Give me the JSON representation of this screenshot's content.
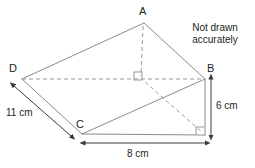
{
  "figure": {
    "kind": "triangular-prism-wedge-diagram",
    "note_line1": "Not drawn",
    "note_line2": "accurately",
    "stroke_color": "#8c8c8c",
    "dash_color": "#9a9a9a",
    "text_color": "#231f20",
    "vertices": [
      {
        "name": "A",
        "label": "A",
        "x": 144,
        "y": 23
      },
      {
        "name": "B",
        "label": "B",
        "x": 205,
        "y": 79
      },
      {
        "name": "C",
        "label": "C",
        "x": 82,
        "y": 134
      },
      {
        "name": "D",
        "label": "D",
        "x": 22,
        "y": 79
      }
    ],
    "vertex_label_positions": {
      "A": {
        "x": 139,
        "y": 6
      },
      "B": {
        "x": 207,
        "y": 63
      },
      "C": {
        "x": 76,
        "y": 119
      },
      "D": {
        "x": 9,
        "y": 63
      }
    },
    "hidden_corner": {
      "name": "E",
      "x": 205,
      "y": 135
    },
    "foot": {
      "name": "F",
      "x": 141,
      "y": 79
    },
    "dimensions": [
      {
        "name": "edge-DC",
        "label": "11 cm",
        "value": 11,
        "unit": "cm",
        "label_x": 6,
        "label_y": 107,
        "arrow": {
          "x1": 14,
          "y1": 86,
          "x2": 71,
          "y2": 136
        }
      },
      {
        "name": "edge-BE-height",
        "label": "6 cm",
        "value": 6,
        "unit": "cm",
        "label_x": 216,
        "label_y": 100,
        "arrow": {
          "x1": 211,
          "y1": 79,
          "x2": 211,
          "y2": 135
        }
      },
      {
        "name": "edge-CE-base",
        "label": "8 cm",
        "value": 8,
        "unit": "cm",
        "label_x": 125,
        "label_y": 149,
        "arrow": {
          "x1": 85,
          "y1": 143,
          "x2": 205,
          "y2": 143
        }
      }
    ],
    "right_angles": [
      {
        "name": "right-angle-apex-foot",
        "x": 141,
        "y": 79
      },
      {
        "name": "right-angle-bottom-corner",
        "x": 205,
        "y": 135
      }
    ],
    "note_position": {
      "x": 182,
      "y": 23
    }
  }
}
